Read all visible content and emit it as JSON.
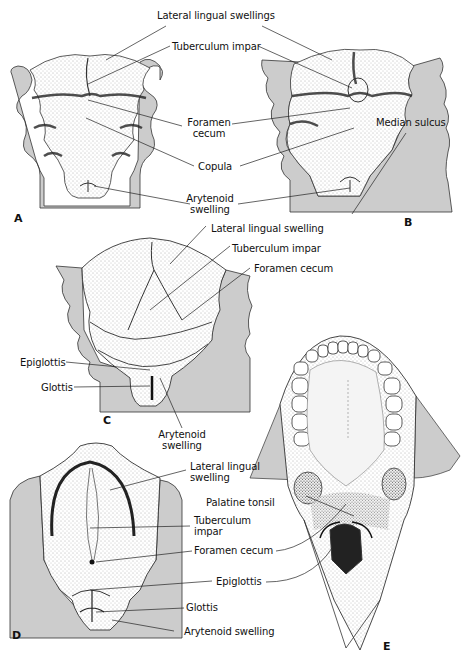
{
  "figure": {
    "colors": {
      "background": "#ffffff",
      "tissue_grey": "#cccccc",
      "ink": "#111111",
      "stipple": "#555555"
    },
    "panels": [
      {
        "id": "A",
        "label": "A"
      },
      {
        "id": "B",
        "label": "B"
      },
      {
        "id": "C",
        "label": "C"
      },
      {
        "id": "D",
        "label": "D"
      },
      {
        "id": "E",
        "label": "E"
      }
    ],
    "labels_AB": {
      "lateral_lingual_swellings": "Lateral lingual swellings",
      "tuberculum_impar": "Tuberculum impar",
      "foramen_cecum_1": "Foramen",
      "foramen_cecum_2": "cecum",
      "copula": "Copula",
      "arytenoid_1": "Arytenoid",
      "arytenoid_2": "swelling"
    },
    "labels_C": {
      "lateral_lingual_swelling": "Lateral lingual swelling",
      "tuberculum_impar": "Tuberculum impar",
      "foramen_cecum": "Foramen cecum",
      "epiglottis": "Epiglottis",
      "glottis": "Glottis",
      "arytenoid_1": "Arytenoid",
      "arytenoid_2": "swelling"
    },
    "labels_D": {
      "lateral_lingual_1": "Lateral lingual",
      "lateral_lingual_2": "swelling",
      "tuberculum_1": "Tuberculum",
      "tuberculum_2": "impar",
      "foramen_cecum": "Foramen cecum",
      "epiglottis": "Epiglottis",
      "glottis": "Glottis",
      "arytenoid_swelling": "Arytenoid swelling"
    },
    "labels_E": {
      "median_sulcus": "Median sulcus",
      "palatine_tonsil": "Palatine tonsil"
    }
  }
}
